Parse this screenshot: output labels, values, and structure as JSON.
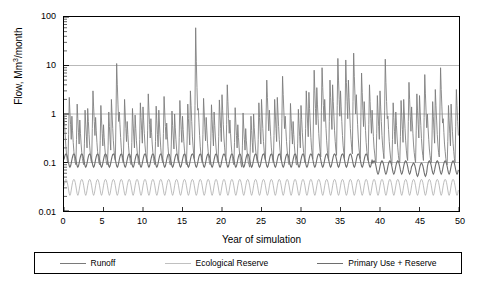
{
  "chart_data": {
    "type": "line",
    "title": "",
    "xlabel": "Year of simulation",
    "ylabel": "Flow, Mm3/month",
    "ylabel_unit_sup": "3",
    "xlim": [
      0,
      50
    ],
    "ylim": [
      0.01,
      100
    ],
    "yscale": "log",
    "grid": true,
    "gridlines_y": [
      0.01,
      0.1,
      1,
      10,
      100
    ],
    "xticks": [
      0,
      5,
      10,
      15,
      20,
      25,
      30,
      35,
      40,
      45,
      50
    ],
    "xtick_labels": [
      "0",
      "5",
      "10",
      "15",
      "20",
      "25",
      "30",
      "35",
      "40",
      "45",
      "50"
    ],
    "yticks": [
      0.01,
      0.1,
      1,
      10,
      100
    ],
    "ytick_labels": [
      "0.01",
      "0.1",
      "1",
      "10",
      "100"
    ],
    "legend_position": "bottom",
    "series": [
      {
        "name": "Runoff",
        "color": "#7a7a7a",
        "x_start": 0,
        "x_step": 0.0833333,
        "values": [
          1.0,
          0.55,
          0.32,
          0.2,
          0.14,
          0.11,
          0.1,
          0.38,
          2.2,
          1.1,
          0.6,
          0.3,
          0.9,
          0.45,
          0.26,
          0.17,
          0.12,
          0.1,
          0.09,
          0.3,
          1.6,
          0.8,
          0.42,
          0.24,
          0.75,
          0.4,
          0.24,
          0.16,
          0.12,
          0.1,
          0.09,
          0.25,
          1.2,
          0.62,
          0.35,
          0.2,
          1.3,
          0.7,
          0.38,
          0.22,
          0.15,
          0.11,
          0.1,
          0.5,
          3.0,
          1.4,
          0.7,
          0.36,
          0.85,
          0.45,
          0.26,
          0.17,
          0.13,
          0.1,
          0.09,
          0.28,
          1.5,
          0.75,
          0.4,
          0.22,
          0.6,
          0.33,
          0.2,
          0.14,
          0.11,
          0.09,
          0.09,
          0.22,
          1.1,
          0.55,
          0.3,
          0.18,
          2.0,
          1.0,
          0.5,
          0.28,
          0.18,
          0.13,
          0.11,
          0.9,
          11.0,
          4.0,
          1.6,
          0.7,
          1.1,
          0.6,
          0.33,
          0.2,
          0.14,
          0.11,
          0.1,
          0.35,
          2.0,
          1.0,
          0.5,
          0.27,
          0.7,
          0.38,
          0.22,
          0.15,
          0.12,
          0.1,
          0.09,
          0.26,
          1.3,
          0.65,
          0.35,
          0.2,
          0.95,
          0.5,
          0.28,
          0.18,
          0.13,
          0.1,
          0.09,
          0.3,
          1.7,
          0.85,
          0.45,
          0.25,
          1.4,
          0.72,
          0.4,
          0.23,
          0.16,
          0.12,
          0.1,
          0.45,
          2.6,
          1.2,
          0.6,
          0.32,
          0.8,
          0.42,
          0.24,
          0.16,
          0.12,
          0.1,
          0.09,
          0.27,
          1.45,
          0.72,
          0.38,
          0.21,
          1.2,
          0.62,
          0.34,
          0.2,
          0.14,
          0.11,
          0.1,
          0.4,
          2.3,
          1.1,
          0.55,
          0.3,
          0.65,
          0.35,
          0.21,
          0.14,
          0.11,
          0.09,
          0.09,
          0.24,
          1.15,
          0.58,
          0.32,
          0.19,
          1.0,
          0.52,
          0.3,
          0.19,
          0.14,
          0.11,
          0.1,
          0.33,
          1.9,
          0.95,
          0.48,
          0.26,
          0.9,
          0.48,
          0.27,
          0.18,
          0.13,
          0.1,
          0.09,
          0.29,
          1.6,
          0.8,
          0.42,
          0.23,
          3.0,
          1.5,
          0.7,
          0.35,
          0.22,
          0.15,
          0.12,
          1.5,
          60.0,
          12.0,
          3.5,
          1.2,
          1.3,
          0.68,
          0.36,
          0.21,
          0.15,
          0.11,
          0.1,
          0.38,
          2.1,
          1.05,
          0.52,
          0.28,
          0.85,
          0.45,
          0.25,
          0.17,
          0.12,
          0.1,
          0.09,
          0.28,
          1.55,
          0.78,
          0.4,
          0.22,
          1.1,
          0.58,
          0.32,
          0.2,
          0.14,
          0.11,
          0.1,
          0.34,
          1.95,
          0.98,
          0.5,
          0.27,
          2.5,
          1.2,
          0.6,
          0.32,
          0.2,
          0.14,
          0.11,
          0.6,
          4.0,
          1.8,
          0.8,
          0.4,
          0.75,
          0.4,
          0.23,
          0.16,
          0.12,
          0.1,
          0.09,
          0.26,
          1.35,
          0.68,
          0.36,
          0.2,
          0.6,
          0.33,
          0.2,
          0.14,
          0.11,
          0.09,
          0.08,
          0.22,
          1.05,
          0.54,
          0.3,
          0.18,
          0.5,
          0.28,
          0.18,
          0.13,
          0.1,
          0.09,
          0.08,
          0.2,
          0.9,
          0.46,
          0.26,
          0.16,
          1.0,
          0.52,
          0.3,
          0.19,
          0.14,
          0.11,
          0.1,
          0.3,
          1.7,
          0.85,
          0.44,
          0.24,
          2.0,
          1.0,
          0.5,
          0.27,
          0.18,
          0.13,
          0.11,
          0.9,
          5.0,
          2.2,
          0.95,
          0.45,
          1.2,
          0.62,
          0.34,
          0.2,
          0.15,
          0.11,
          0.1,
          0.36,
          2.0,
          1.0,
          0.5,
          0.27,
          2.2,
          1.1,
          0.55,
          0.3,
          0.19,
          0.14,
          0.11,
          0.8,
          6.0,
          2.5,
          1.1,
          0.5,
          0.9,
          0.48,
          0.27,
          0.18,
          0.13,
          0.1,
          0.09,
          0.3,
          1.65,
          0.82,
          0.43,
          0.24,
          0.7,
          0.38,
          0.22,
          0.15,
          0.11,
          0.09,
          0.09,
          0.25,
          1.25,
          0.63,
          0.34,
          0.2,
          1.5,
          0.78,
          0.42,
          0.24,
          0.16,
          0.12,
          0.1,
          0.5,
          3.0,
          1.4,
          0.65,
          0.34,
          2.8,
          1.3,
          0.65,
          0.33,
          0.2,
          0.15,
          0.12,
          1.0,
          8.0,
          3.0,
          1.3,
          0.6,
          3.5,
          1.6,
          0.8,
          0.4,
          0.24,
          0.17,
          0.13,
          1.2,
          9.0,
          3.5,
          1.5,
          0.7,
          2.0,
          1.0,
          0.5,
          0.28,
          0.18,
          0.13,
          0.11,
          0.7,
          5.0,
          2.2,
          1.0,
          0.48,
          4.0,
          1.8,
          0.9,
          0.45,
          0.27,
          0.18,
          0.14,
          1.5,
          14.0,
          5.0,
          2.0,
          0.9,
          3.0,
          1.4,
          0.7,
          0.36,
          0.22,
          0.16,
          0.12,
          1.1,
          13.0,
          4.5,
          1.8,
          0.8,
          5.0,
          2.2,
          1.0,
          0.5,
          0.3,
          0.2,
          0.15,
          1.8,
          18.0,
          6.0,
          2.4,
          1.0,
          2.5,
          1.2,
          0.6,
          0.32,
          0.2,
          0.15,
          0.12,
          0.9,
          7.0,
          2.8,
          1.2,
          0.55,
          1.8,
          0.9,
          0.46,
          0.26,
          0.17,
          0.13,
          0.11,
          0.6,
          4.0,
          1.8,
          0.8,
          0.4,
          1.2,
          0.62,
          0.34,
          0.2,
          0.15,
          0.11,
          0.1,
          0.4,
          2.4,
          1.15,
          0.55,
          0.3,
          3.0,
          1.4,
          0.7,
          0.36,
          0.22,
          0.16,
          0.12,
          1.2,
          13.5,
          4.5,
          1.8,
          0.8,
          0.9,
          0.48,
          0.27,
          0.18,
          0.13,
          0.1,
          0.09,
          0.3,
          1.7,
          0.85,
          0.44,
          0.24,
          1.1,
          0.58,
          0.32,
          0.2,
          0.14,
          0.11,
          0.1,
          0.34,
          1.9,
          0.95,
          0.48,
          0.26,
          2.0,
          1.0,
          0.5,
          0.28,
          0.18,
          0.13,
          0.11,
          0.7,
          4.5,
          2.0,
          0.9,
          0.44,
          1.4,
          0.72,
          0.4,
          0.23,
          0.16,
          0.12,
          0.1,
          0.45,
          2.6,
          1.2,
          0.6,
          0.32,
          2.4,
          1.15,
          0.58,
          0.31,
          0.19,
          0.14,
          0.11,
          0.85,
          6.5,
          2.6,
          1.1,
          0.52,
          1.0,
          0.52,
          0.3,
          0.19,
          0.14,
          0.11,
          0.1,
          0.32,
          1.8,
          0.9,
          0.46,
          0.25,
          3.2,
          1.5,
          0.75,
          0.38,
          0.23,
          0.16,
          0.13,
          1.1,
          9.0,
          3.2,
          1.4,
          0.65,
          0.8,
          0.42,
          0.24,
          0.17,
          0.12,
          0.1,
          0.09,
          0.27,
          1.5,
          0.75,
          0.4,
          0.22,
          1.6,
          0.82,
          0.44,
          0.25,
          0.17,
          0.12,
          0.1,
          0.55,
          3.2,
          1.5,
          0.7,
          0.36
        ]
      },
      {
        "name": "Ecological Reserve",
        "color": "#b5b5b5",
        "x_start": 0,
        "x_step": 0.0833333,
        "base": 0.033,
        "amplitude": 0.012,
        "description": "near-constant sawtooth around 0.03-0.045"
      },
      {
        "name": "Primary Use + Reserve",
        "color": "#6e6e6e",
        "x_start": 0,
        "x_step": 0.0833333,
        "base": 0.115,
        "amplitude": 0.035,
        "description": "near-constant sawtooth around 0.10-0.16, dips near year 40-50"
      }
    ]
  },
  "legend": {
    "items": [
      {
        "label": "Runoff",
        "color": "#7a7a7a"
      },
      {
        "label": "Ecological Reserve",
        "color": "#b5b5b5"
      },
      {
        "label": "Primary Use + Reserve",
        "color": "#6e6e6e"
      }
    ]
  },
  "axes": {
    "y_title_main": "Flow, Mm",
    "y_title_sup": "3",
    "y_title_rest": "/month",
    "x_title": "Year of simulation"
  }
}
